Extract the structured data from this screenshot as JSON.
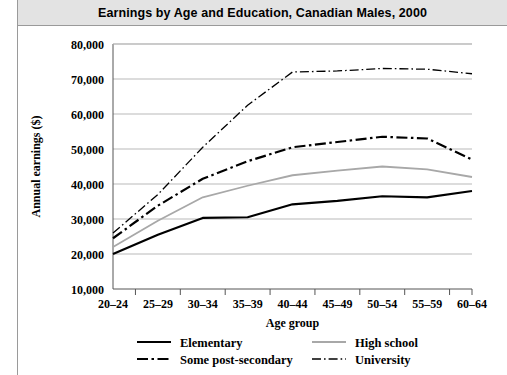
{
  "header": {
    "title": "Earnings by Age and Education, Canadian Males, 2000"
  },
  "chart_data": {
    "type": "line",
    "title": "Earnings by Age and Education, Canadian Males, 2000",
    "xlabel": "Age group",
    "ylabel": "Annual earnings ($)",
    "categories": [
      "20–24",
      "25–29",
      "30–34",
      "35–39",
      "40–44",
      "45–49",
      "50–54",
      "55–59",
      "60–64"
    ],
    "ylim": [
      10000,
      80000
    ],
    "ytick_step": 10000,
    "ytick_labels": [
      "10,000",
      "20,000",
      "30,000",
      "40,000",
      "50,000",
      "60,000",
      "70,000",
      "80,000"
    ],
    "ytick_values": [
      10000,
      20000,
      30000,
      40000,
      50000,
      60000,
      70000,
      80000
    ],
    "grid": "horizontal",
    "legend_position": "bottom",
    "series": [
      {
        "name": "Elementary",
        "color": "#000000",
        "style": "solid",
        "width": 2.2,
        "values": [
          20000,
          25500,
          30300,
          30500,
          34200,
          35200,
          36500,
          36200,
          38000
        ]
      },
      {
        "name": "High school",
        "color": "#a8a8a8",
        "style": "solid",
        "width": 1.8,
        "values": [
          22000,
          29500,
          36200,
          39500,
          42500,
          43800,
          45000,
          44200,
          42000
        ]
      },
      {
        "name": "Some post-secondary",
        "color": "#000000",
        "style": "dashdot-thick",
        "width": 2.2,
        "values": [
          24500,
          33800,
          41500,
          46500,
          50500,
          52000,
          53500,
          53000,
          47000
        ]
      },
      {
        "name": "University",
        "color": "#000000",
        "style": "dashdot-thin",
        "width": 1.3,
        "values": [
          26000,
          37000,
          50500,
          62500,
          72000,
          72300,
          73000,
          72800,
          71500
        ]
      }
    ]
  },
  "legend": {
    "items": [
      {
        "label": "Elementary",
        "series_index": 0
      },
      {
        "label": "High school",
        "series_index": 1
      },
      {
        "label": "Some post-secondary",
        "series_index": 2
      },
      {
        "label": "University",
        "series_index": 3
      }
    ]
  }
}
